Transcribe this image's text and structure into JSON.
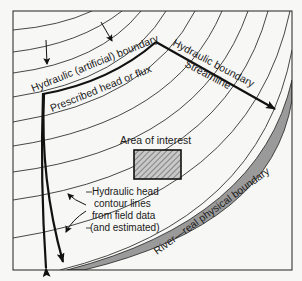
{
  "diagram": {
    "labels": {
      "hydraulic_artificial_boundary": "Hydraulic (artificial) boundary",
      "prescribed_head_or_flux": "Prescribed head or flux",
      "hydraulic_boundary": "Hydraulic boundary",
      "streamline": "Streamline",
      "area_of_interest": "Area of interest",
      "contour_note_line1": "Hydraulic head",
      "contour_note_line2": "contour lines",
      "contour_note_line3": "from field data",
      "contour_note_line4": "(and estimated)",
      "river_boundary": "River—real physical boundary"
    },
    "colors": {
      "background": "#f7f7f5",
      "line": "#1a1a1a",
      "contour": "#333333",
      "river_fill": "#9a9a9a",
      "hatch": "#555555"
    },
    "icons": [
      "flow-direction-arrow-icon",
      "flow-direction-arrow-icon",
      "callout-arrow-icon",
      "callout-arrow-icon"
    ]
  }
}
